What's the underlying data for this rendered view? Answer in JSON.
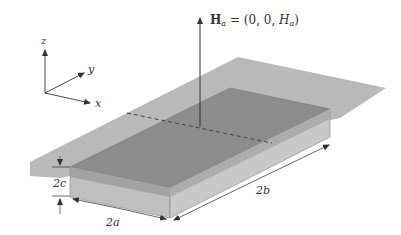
{
  "figure": {
    "field_label": {
      "bold": "H",
      "sub": "a",
      "rest": " = (0, 0, ",
      "italic": "H",
      "sub2": "a",
      "close": ")"
    },
    "axes": {
      "x": "x",
      "y": "y",
      "z": "z"
    },
    "dimensions": {
      "thickness": "2c",
      "width": "2a",
      "length": "2b"
    },
    "colors": {
      "plane": "#b4b4b4",
      "slab_top": "#8a8a8a",
      "slab_front": "#bdbdbd",
      "slab_side": "#c6c6c6",
      "line": "#444444"
    }
  }
}
